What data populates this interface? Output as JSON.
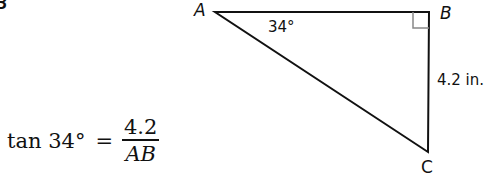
{
  "figure": {
    "clipped_label": "B",
    "triangle": {
      "vertices": {
        "A": {
          "label": "A",
          "x": 215,
          "y": 12
        },
        "B": {
          "label": "B",
          "x": 429,
          "y": 12
        },
        "C": {
          "label": "C",
          "x": 428,
          "y": 152
        }
      },
      "angle_A": "34°",
      "side_BC": "4.2 in.",
      "right_angle_at": "B"
    },
    "equation": {
      "lhs": "tan 34°",
      "equals": "=",
      "numerator": "4.2",
      "denominator": "AB"
    },
    "colors": {
      "stroke": "#111111",
      "right_angle_mark": "#888888",
      "background": "#ffffff"
    }
  }
}
